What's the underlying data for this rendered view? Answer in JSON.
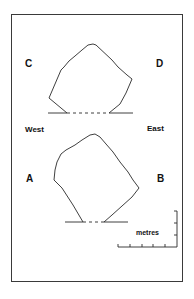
{
  "figure": {
    "labels": {
      "c": "C",
      "d": "D",
      "a": "A",
      "b": "B",
      "west": "West",
      "east": "East"
    },
    "scale": {
      "unit_label": "metres",
      "horizontal_ticks": 5,
      "vertical_ticks": 3
    },
    "colors": {
      "line": "#2a2a2a",
      "frame": "#3a3a3a",
      "background": "#ffffff"
    }
  }
}
